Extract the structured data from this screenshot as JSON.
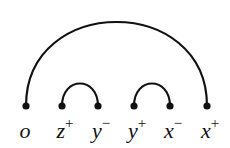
{
  "diagram": {
    "type": "arc-diagram",
    "nodes": [
      {
        "id": "o",
        "base": "o",
        "sup": "",
        "x": 26
      },
      {
        "id": "z+",
        "base": "z",
        "sup": "+",
        "x": 62
      },
      {
        "id": "y-",
        "base": "y",
        "sup": "−",
        "x": 98
      },
      {
        "id": "y+",
        "base": "y",
        "sup": "+",
        "x": 134
      },
      {
        "id": "x-",
        "base": "x",
        "sup": "−",
        "x": 170
      },
      {
        "id": "x+",
        "base": "x",
        "sup": "+",
        "x": 207
      }
    ],
    "arcs": [
      {
        "from": "o",
        "to": "x+"
      },
      {
        "from": "z+",
        "to": "y-"
      },
      {
        "from": "y+",
        "to": "x-"
      }
    ],
    "colors": {
      "stroke": "#111111",
      "background": "#ffffff"
    }
  }
}
